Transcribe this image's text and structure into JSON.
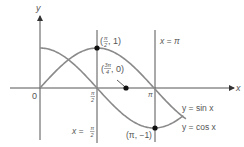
{
  "figure": {
    "colors": {
      "axis": "#444444",
      "curve": "#8a8a8a",
      "line": "#555555",
      "point": "#111111",
      "text": "#555555"
    },
    "axes": {
      "x_label": "x",
      "y_label": "y",
      "origin_label": "0",
      "tick_pi_over_2_num": "π",
      "tick_pi_over_2_den": "2",
      "tick_pi": "π"
    },
    "curves": [
      {
        "name": "sine",
        "label": "y = sin x"
      },
      {
        "name": "cosine",
        "label": "y = cos x"
      }
    ],
    "vertical_lines": [
      {
        "name": "x-pi-over-2",
        "label_prefix": "x =",
        "label_num": "π",
        "label_den": "2"
      },
      {
        "name": "x-pi",
        "label": "x = π"
      }
    ],
    "points": [
      {
        "name": "pi-over-2-one",
        "prefix": "(",
        "num": "π",
        "den": "2",
        "suffix": ", 1)"
      },
      {
        "name": "three-pi-over-4-zero",
        "prefix": "(",
        "num": "3π",
        "den": "4",
        "suffix": ", 0)"
      },
      {
        "name": "pi-minus-one",
        "label": "(π, −1)"
      }
    ]
  }
}
